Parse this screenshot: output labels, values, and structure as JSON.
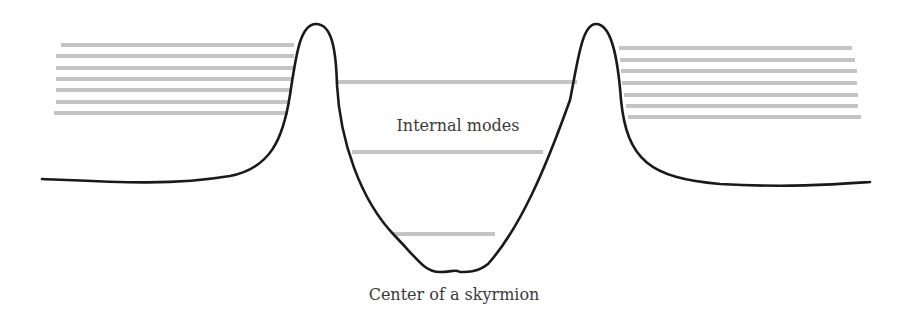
{
  "diagram": {
    "title": "",
    "labels": {
      "internal_modes": "Internal modes",
      "center": "Center of a skyrmion"
    },
    "colors": {
      "curve": "#1a1a1a",
      "mode_lines": "#c4c4c4",
      "text": "#3a3a3a",
      "background": "#ffffff"
    },
    "potential_curve": {
      "description": "Potential profile with two sharp peaks bounding a well; flat tails on either side",
      "path": "M42,179 C110,182 170,186 230,176 C270,168 283,140 290,95 C296,55 300,24 316,24 C332,24 336,50 337,85 C340,140 360,200 395,236 C420,262 425,272 440,272 C452,272 455,269 460,272 C468,272 478,272 488,264 C520,228 545,170 570,100 C578,60 582,24 596,24 C612,24 618,60 621,100 C627,160 650,178 720,184 C790,188 840,184 870,182"
    },
    "internal_mode_lines": [
      {
        "y": 82,
        "x1": 336,
        "x2": 577
      },
      {
        "y": 152,
        "x1": 352,
        "x2": 543
      },
      {
        "y": 234,
        "x1": 393,
        "x2": 495
      }
    ],
    "left_continuum_lines": [
      {
        "y": 45,
        "x1": 61,
        "x2": 294
      },
      {
        "y": 56,
        "x1": 56,
        "x2": 294
      },
      {
        "y": 68,
        "x1": 56,
        "x2": 294
      },
      {
        "y": 79,
        "x1": 56,
        "x2": 292
      },
      {
        "y": 90,
        "x1": 56,
        "x2": 291
      },
      {
        "y": 102,
        "x1": 56,
        "x2": 290
      },
      {
        "y": 113,
        "x1": 54,
        "x2": 288
      }
    ],
    "right_continuum_lines": [
      {
        "y": 48,
        "x1": 619,
        "x2": 852
      },
      {
        "y": 60,
        "x1": 620,
        "x2": 855
      },
      {
        "y": 71,
        "x1": 621,
        "x2": 857
      },
      {
        "y": 83,
        "x1": 622,
        "x2": 857
      },
      {
        "y": 95,
        "x1": 624,
        "x2": 858
      },
      {
        "y": 106,
        "x1": 626,
        "x2": 858
      },
      {
        "y": 117,
        "x1": 628,
        "x2": 861
      }
    ]
  }
}
